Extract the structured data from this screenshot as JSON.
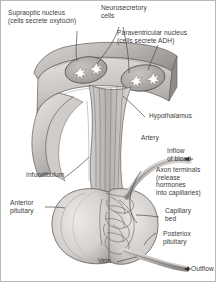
{
  "figure": {
    "background_color": "#ffffff",
    "text_color": "#3a3a3a",
    "border_color": "#b9b9b9"
  },
  "palette": {
    "tissue_light": "#e2e0de",
    "tissue_mid": "#c9c6c3",
    "tissue_dark": "#a8a5a2",
    "tissue_darker": "#8d8a87",
    "nucleus_fill": "#b5b2af",
    "cell_white": "#fdfdfd",
    "vessel_gray": "#b0adaa",
    "outline": "#5e5c5a",
    "leader_line": "#4a4848"
  },
  "labels": [
    {
      "id": "supraoptic-nucleus",
      "lines": [
        "Supraoptic nucleus",
        "(cells secrete oxytocin)"
      ],
      "text": "Supraoptic nucleus\n(cells secrete oxytocin)"
    },
    {
      "id": "neurosecretory-cells",
      "lines": [
        "Neurosecretory",
        "cells"
      ],
      "text": "Neurosecretory\ncells"
    },
    {
      "id": "paraventricular-nucleus",
      "lines": [
        "Paraventricular nucleus",
        "(cells secrete ADH)"
      ],
      "text": "Paraventricular nucleus\n(cells secrete ADH)"
    },
    {
      "id": "hypothalamus",
      "lines": [
        "Hypothalamus"
      ],
      "text": "Hypothalamus"
    },
    {
      "id": "artery",
      "lines": [
        "Artery"
      ],
      "text": "Artery"
    },
    {
      "id": "inflow-of-blood",
      "lines": [
        "Inflow",
        "of blood"
      ],
      "text": "Inflow\nof blood"
    },
    {
      "id": "axon-terminals",
      "lines": [
        "Axon terminals",
        "(release",
        "hormones",
        "into capillaries)"
      ],
      "text": "Axon terminals\n(release\nhormones\ninto capillaries)"
    },
    {
      "id": "capillary-bed",
      "lines": [
        "Capillary",
        "bed"
      ],
      "text": "Capillary\nbed"
    },
    {
      "id": "posterior-pituitary",
      "lines": [
        "Posteriox",
        "pituitary"
      ],
      "text": "Posteriox\npituitary"
    },
    {
      "id": "infundibulum",
      "lines": [
        "Infundibulum"
      ],
      "text": "Infundibulum"
    },
    {
      "id": "anterior-pituitary",
      "lines": [
        "Anterior",
        "pituitary"
      ],
      "text": "Anterior\npituitary"
    },
    {
      "id": "vein",
      "lines": [
        "Vein"
      ],
      "text": "Vein"
    },
    {
      "id": "outflow",
      "lines": [
        "Outflow"
      ],
      "text": "Outflow"
    }
  ],
  "structures": [
    {
      "id": "hypothalamus-wedge",
      "name": "hypothalamus tissue block"
    },
    {
      "id": "supraoptic-nucleus-oval",
      "name": "supraoptic nucleus region",
      "cell_count": 2
    },
    {
      "id": "paraventricular-nucleus-oval",
      "name": "paraventricular nucleus region",
      "cell_count": 2
    },
    {
      "id": "infundibulum-stalk",
      "name": "infundibulum (pituitary stalk)"
    },
    {
      "id": "axon-bundle",
      "name": "descending axon fiber bundle"
    },
    {
      "id": "anterior-pituitary-lobe",
      "name": "anterior pituitary lobe"
    },
    {
      "id": "posterior-pituitary-lobe",
      "name": "posterior pituitary lobe"
    },
    {
      "id": "capillary-network",
      "name": "capillary bed network"
    },
    {
      "id": "artery-vessel",
      "name": "artery supplying pituitary"
    },
    {
      "id": "vein-vessel",
      "name": "vein draining pituitary"
    }
  ]
}
